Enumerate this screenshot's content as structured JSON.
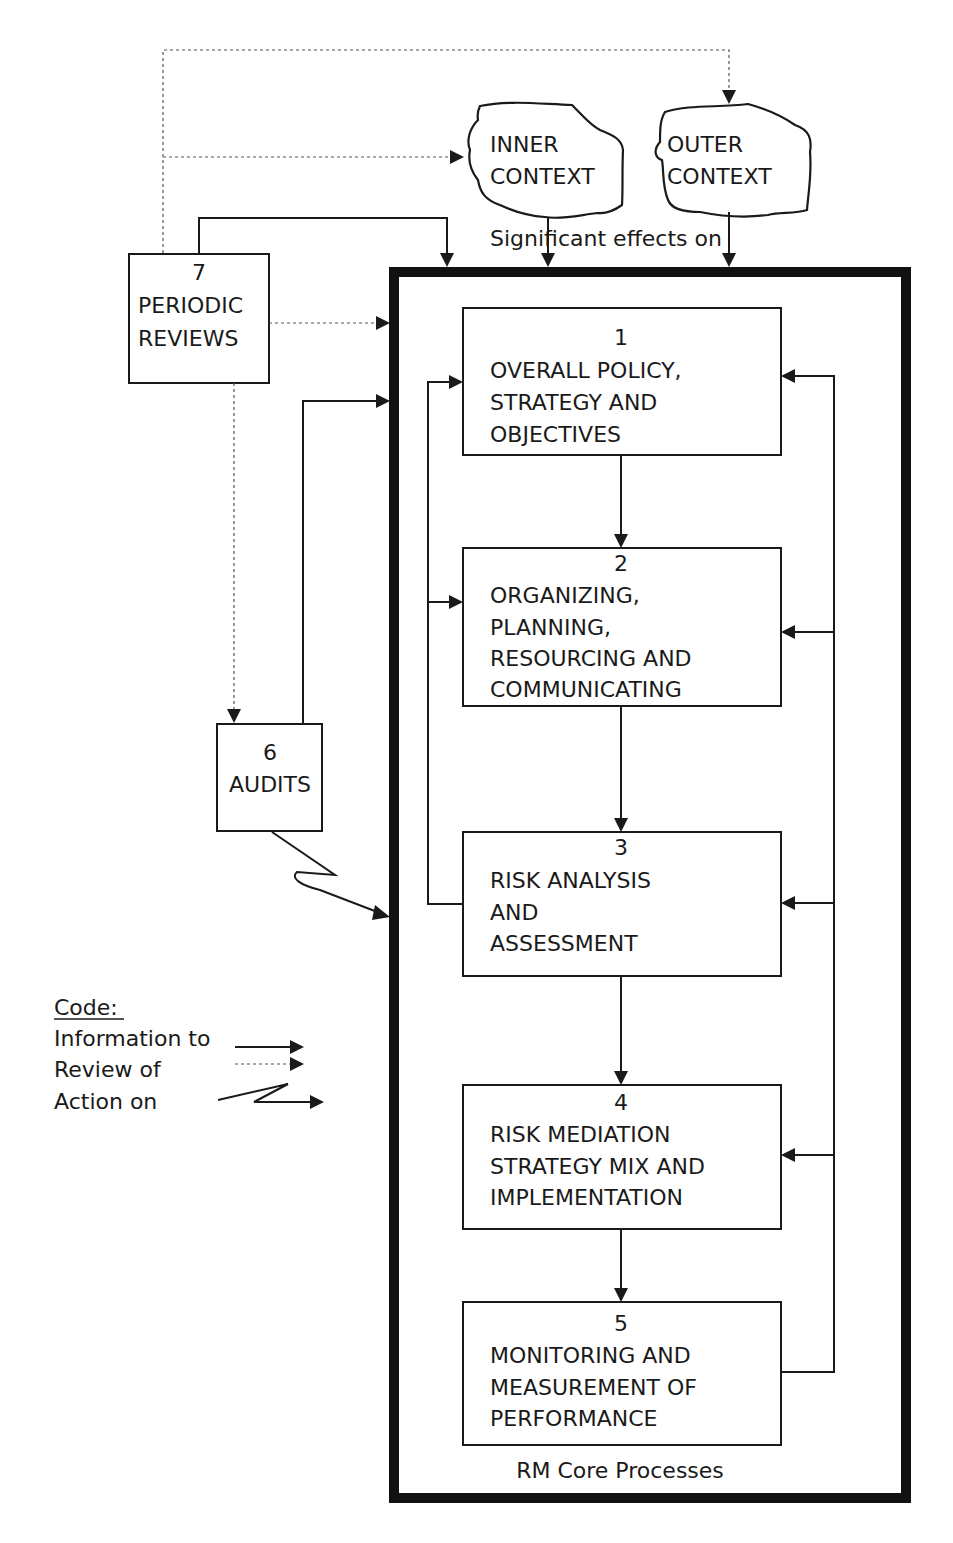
{
  "diagram": {
    "type": "flowchart",
    "title_clipped": "",
    "context": {
      "inner": {
        "line1": "INNER",
        "line2": "CONTEXT"
      },
      "outer": {
        "line1": "OUTER",
        "line2": "CONTEXT"
      },
      "effects_label": "Significant effects on"
    },
    "periodic_reviews": {
      "number": "7",
      "line1": "PERIODIC",
      "line2": "REVIEWS"
    },
    "audits": {
      "number": "6",
      "line1": "AUDITS"
    },
    "core": {
      "label": "RM Core Processes",
      "boxes": [
        {
          "number": "1",
          "lines": [
            "OVERALL POLICY,",
            "STRATEGY AND",
            "OBJECTIVES"
          ]
        },
        {
          "number": "2",
          "lines": [
            "ORGANIZING,",
            "PLANNING,",
            "RESOURCING AND",
            "COMMUNICATING"
          ]
        },
        {
          "number": "3",
          "lines": [
            "RISK ANALYSIS",
            "AND",
            "ASSESSMENT"
          ]
        },
        {
          "number": "4",
          "lines": [
            "RISK MEDIATION",
            "STRATEGY MIX AND",
            "IMPLEMENTATION"
          ]
        },
        {
          "number": "5",
          "lines": [
            "MONITORING AND",
            "MEASUREMENT OF",
            "PERFORMANCE"
          ]
        }
      ]
    },
    "legend": {
      "title": "Code:",
      "items": [
        {
          "label": "Information to",
          "style": "solid-arrow"
        },
        {
          "label": "Review of",
          "style": "dotted-arrow"
        },
        {
          "label": "Action on",
          "style": "zigzag-arrow"
        }
      ]
    }
  }
}
